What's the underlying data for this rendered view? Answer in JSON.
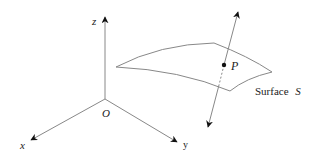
{
  "diagram": {
    "axes": {
      "origin_label": "O",
      "x_label": "x",
      "y_label": "y",
      "z_label": "z"
    },
    "surface": {
      "label_prefix": "Surface",
      "label_symbol": "S"
    },
    "point": {
      "label": "P"
    },
    "colors": {
      "line": "#888888",
      "arrow": "#111111",
      "text": "#222222"
    }
  }
}
